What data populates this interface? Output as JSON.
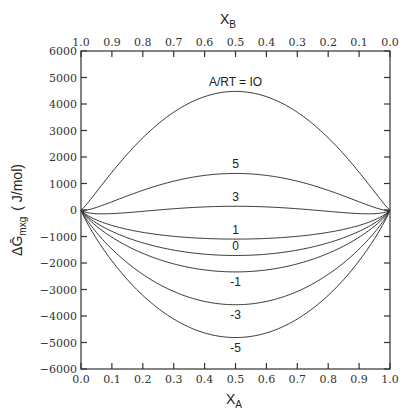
{
  "chart_data": {
    "type": "line",
    "title": "",
    "xlabel": "X_A",
    "xlabel_top": "X_B",
    "ylabel": "ΔḠmxg (J/mol)",
    "xlim": [
      0.0,
      1.0
    ],
    "ylim": [
      -6000,
      6000
    ],
    "grid": false,
    "legend": "inline curve labels",
    "x_ticks": [
      "0.0",
      "0.1",
      "0.2",
      "0.3",
      "0.4",
      "0.5",
      "0.6",
      "0.7",
      "0.8",
      "0.9",
      "1.0"
    ],
    "x_top_ticks": [
      "1.0",
      "0.9",
      "0.8",
      "0.7",
      "0.6",
      "0.5",
      "0.4",
      "0.3",
      "0.2",
      "0.1",
      "0.0"
    ],
    "y_ticks": [
      "6000",
      "5000",
      "4000",
      "3000",
      "2000",
      "1000",
      "0",
      "-1000",
      "-2000",
      "-3000",
      "-4000",
      "-5000",
      "-6000"
    ],
    "model": "ΔG_mix = RT[x ln x + (1-x) ln(1-x)] + A x(1-x), RT ≈ 2477 J/mol",
    "RT": 2477,
    "x": [
      0.0,
      0.1,
      0.2,
      0.3,
      0.4,
      0.5,
      0.6,
      0.7,
      0.8,
      0.9,
      1.0
    ],
    "series": [
      {
        "name": "A/RT = 10",
        "label": "A/RT = IO",
        "a_over_rt": 10,
        "values": [
          0,
          1424,
          2723,
          3714,
          4277,
          4476,
          4277,
          3714,
          2723,
          1424,
          0
        ]
      },
      {
        "name": "5",
        "label": "5",
        "a_over_rt": 5,
        "values": [
          0,
          310,
          741,
          1113,
          1305,
          1380,
          1305,
          1113,
          741,
          310,
          0
        ]
      },
      {
        "name": "3",
        "label": "3",
        "a_over_rt": 3,
        "values": [
          0,
          -136,
          -52,
          73,
          116,
          141,
          116,
          73,
          -52,
          -136,
          0
        ]
      },
      {
        "name": "1",
        "label": "1",
        "a_over_rt": 1,
        "values": [
          0,
          -583,
          -844,
          -967,
          -1073,
          -1098,
          -1073,
          -967,
          -844,
          -583,
          0
        ]
      },
      {
        "name": "0",
        "label": "0",
        "a_over_rt": 0,
        "values": [
          0,
          -806,
          -1240,
          -1513,
          -1667,
          -1717,
          -1667,
          -1513,
          -1240,
          -806,
          0
        ]
      },
      {
        "name": "-1",
        "label": "-1",
        "a_over_rt": -1,
        "values": [
          0,
          -1029,
          -1636,
          -2026,
          -2262,
          -2336,
          -2262,
          -2026,
          -1636,
          -1029,
          0
        ]
      },
      {
        "name": "-3",
        "label": "-3",
        "a_over_rt": -3,
        "values": [
          0,
          -1475,
          -2429,
          -3067,
          -3451,
          -3576,
          -3451,
          -3067,
          -2429,
          -1475,
          0
        ]
      },
      {
        "name": "-5",
        "label": "-5",
        "a_over_rt": -5,
        "values": [
          0,
          -1921,
          -3222,
          -4108,
          -4640,
          -4815,
          -4640,
          -4108,
          -3222,
          -1921,
          0
        ]
      }
    ]
  },
  "labels": {
    "x_axis_title": "X",
    "x_axis_sub": "A",
    "x_top_title": "X",
    "x_top_sub": "B",
    "y_axis_title": "ΔḠ",
    "y_axis_sub": "mxg",
    "y_axis_units": "( J/mol)"
  }
}
